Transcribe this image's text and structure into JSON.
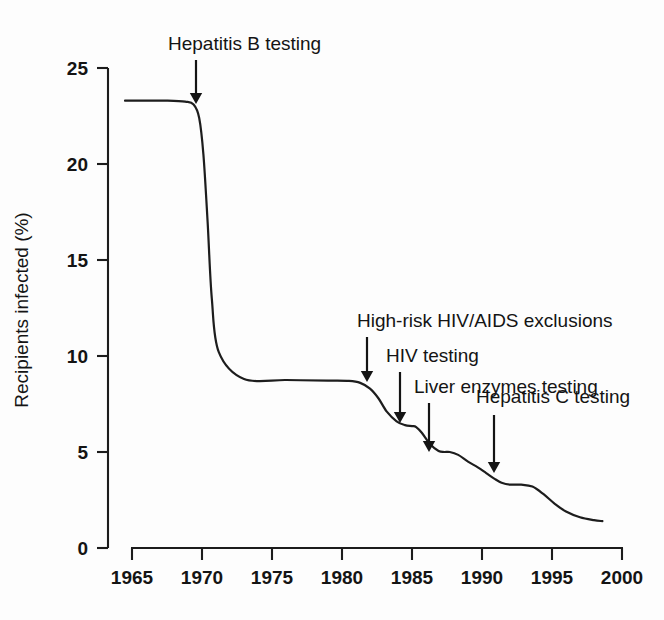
{
  "chart_data": {
    "type": "line",
    "title": "",
    "xlabel": "",
    "ylabel": "Recipients infected (%)",
    "xlim": [
      1964,
      2000
    ],
    "ylim": [
      0,
      25
    ],
    "grid": false,
    "legend": null,
    "xticks": [
      "1965",
      "1970",
      "1975",
      "1980",
      "1985",
      "1990",
      "1995",
      "2000"
    ],
    "xtick_values": [
      1965,
      1970,
      1975,
      1980,
      1985,
      1990,
      1995,
      2000
    ],
    "yticks": [
      "0",
      "5",
      "10",
      "15",
      "20",
      "25"
    ],
    "ytick_values": [
      0,
      5,
      10,
      15,
      20,
      25
    ],
    "series": [
      {
        "name": "Recipients infected",
        "x": [
          1964.5,
          1966.0,
          1967.5,
          1968.8,
          1969.4,
          1969.8,
          1970.1,
          1970.4,
          1970.7,
          1971.2,
          1973.0,
          1976.0,
          1979.0,
          1980.5,
          1981.3,
          1982.0,
          1982.6,
          1983.2,
          1983.9,
          1984.5,
          1985.0,
          1985.3,
          1985.7,
          1986.3,
          1986.9,
          1987.3,
          1987.7,
          1988.3,
          1989.0,
          1989.7,
          1990.3,
          1990.9,
          1991.4,
          1992.0,
          1992.8,
          1993.6,
          1994.4,
          1995.2,
          1996.0,
          1997.0,
          1998.0,
          1998.6
        ],
        "y": [
          23.3,
          23.3,
          23.3,
          23.25,
          23.1,
          22.4,
          20.5,
          17.0,
          13.0,
          10.2,
          8.8,
          8.75,
          8.72,
          8.7,
          8.6,
          8.3,
          7.8,
          7.1,
          6.6,
          6.4,
          6.35,
          6.3,
          6.0,
          5.4,
          5.05,
          5.0,
          5.0,
          4.85,
          4.5,
          4.2,
          3.9,
          3.6,
          3.4,
          3.3,
          3.3,
          3.2,
          2.8,
          2.3,
          1.9,
          1.6,
          1.45,
          1.4
        ]
      }
    ],
    "annotations": [
      {
        "id": "hepatitis-b-testing",
        "label": "Hepatitis B testing",
        "text_x": 168,
        "text_y": 50,
        "arrow_x": 196,
        "arrow_y_start": 60,
        "arrow_y_end": 104
      },
      {
        "id": "high-risk-hiv-aids-exclusions",
        "label": "High-risk HIV/AIDS exclusions",
        "text_x": 357,
        "text_y": 327,
        "arrow_x": 367,
        "arrow_y_start": 337,
        "arrow_y_end": 382
      },
      {
        "id": "hiv-testing",
        "label": "HIV testing",
        "text_x": 386,
        "text_y": 362,
        "arrow_x": 400,
        "arrow_y_start": 372,
        "arrow_y_end": 423
      },
      {
        "id": "liver-enzymes-testing",
        "label": "Liver enzymes testing",
        "text_x": 414,
        "text_y": 393,
        "arrow_x": 429,
        "arrow_y_start": 403,
        "arrow_y_end": 452
      },
      {
        "id": "hepatitis-c-testing",
        "label": "Hepatitis C testing",
        "text_x": 476,
        "text_y": 403,
        "arrow_x": 494,
        "arrow_y_start": 415,
        "arrow_y_end": 473
      }
    ]
  },
  "colors": {
    "line": "#1d1d1d",
    "axis": "#1c1c1c",
    "text": "#141414",
    "background": "#fdfdfd"
  }
}
